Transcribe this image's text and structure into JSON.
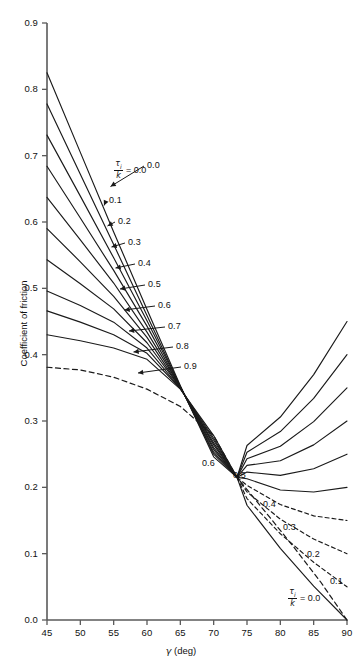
{
  "chart_data": {
    "type": "line",
    "title": "",
    "xlabel": "γ (deg)",
    "ylabel": "Coefficient of friction",
    "xlim": [
      45,
      90
    ],
    "ylim": [
      0.0,
      0.9
    ],
    "xticks": [
      "45",
      "50",
      "55",
      "60",
      "65",
      "70",
      "75",
      "80",
      "85",
      "90"
    ],
    "xtick_values": [
      45,
      50,
      55,
      60,
      65,
      70,
      75,
      80,
      85,
      90
    ],
    "yticks": [
      "0.0",
      "0.1",
      "0.2",
      "0.3",
      "0.4",
      "0.5",
      "0.6",
      "0.7",
      "0.8",
      "0.9"
    ],
    "ytick_values": [
      0.0,
      0.1,
      0.2,
      0.3,
      0.4,
      0.5,
      0.6,
      0.7,
      0.8,
      0.9
    ],
    "grid": false,
    "legend": "inline-curve-labels",
    "series_parameter_symbol": "τi/k",
    "convergence_point": {
      "x": 73.5,
      "y": 0.215
    },
    "series": [
      {
        "name": "0.0",
        "label": "0.0",
        "style": "solid",
        "x": [
          45,
          50,
          55,
          60,
          65,
          70,
          73.5,
          75,
          80,
          85,
          90
        ],
        "values": [
          0.825,
          0.705,
          0.585,
          0.468,
          0.353,
          0.246,
          0.215,
          0.173,
          0.108,
          0.051,
          0.0
        ]
      },
      {
        "name": "0.1",
        "label": "0.1",
        "style": "solid-left-dashed-right",
        "x": [
          45,
          50,
          55,
          60,
          65,
          70,
          73.5,
          75,
          80,
          85,
          90
        ],
        "values": [
          0.778,
          0.672,
          0.566,
          0.459,
          0.352,
          0.25,
          0.215,
          0.183,
          0.13,
          0.087,
          0.05
        ]
      },
      {
        "name": "0.2",
        "label": "0.2",
        "style": "solid-left-dashed-right",
        "x": [
          45,
          50,
          55,
          60,
          65,
          70,
          73.5,
          75,
          80,
          85,
          90
        ],
        "values": [
          0.731,
          0.639,
          0.546,
          0.451,
          0.352,
          0.253,
          0.215,
          0.193,
          0.152,
          0.122,
          0.1
        ]
      },
      {
        "name": "0.3",
        "label": "0.3",
        "style": "solid-left-dashed-right",
        "x": [
          45,
          50,
          55,
          60,
          65,
          70,
          73.5,
          75,
          80,
          85,
          90
        ],
        "values": [
          0.684,
          0.606,
          0.527,
          0.443,
          0.351,
          0.257,
          0.215,
          0.203,
          0.174,
          0.157,
          0.15
        ]
      },
      {
        "name": "0.4",
        "label": "0.4",
        "style": "solid",
        "x": [
          45,
          50,
          55,
          60,
          65,
          70,
          73.5,
          75,
          80,
          85,
          90
        ],
        "values": [
          0.637,
          0.573,
          0.508,
          0.434,
          0.351,
          0.26,
          0.215,
          0.213,
          0.196,
          0.193,
          0.2
        ]
      },
      {
        "name": "0.5",
        "label": "0.5",
        "style": "solid",
        "x": [
          45,
          50,
          55,
          60,
          65,
          70,
          73.5,
          75,
          80,
          85,
          90
        ],
        "values": [
          0.59,
          0.54,
          0.488,
          0.426,
          0.35,
          0.264,
          0.215,
          0.223,
          0.218,
          0.228,
          0.25
        ]
      },
      {
        "name": "0.6",
        "label": "0.6",
        "style": "solid",
        "x": [
          45,
          50,
          55,
          60,
          65,
          70,
          73.5,
          75,
          80,
          85,
          90
        ],
        "values": [
          0.543,
          0.507,
          0.469,
          0.418,
          0.35,
          0.267,
          0.215,
          0.233,
          0.24,
          0.264,
          0.3
        ]
      },
      {
        "name": "0.7",
        "label": "0.7",
        "style": "solid",
        "x": [
          45,
          50,
          55,
          60,
          65,
          70,
          73.5,
          75,
          80,
          85,
          90
        ],
        "values": [
          0.496,
          0.474,
          0.449,
          0.41,
          0.349,
          0.271,
          0.215,
          0.243,
          0.262,
          0.299,
          0.35
        ]
      },
      {
        "name": "0.8",
        "label": "0.8",
        "style": "solid",
        "x": [
          45,
          50,
          55,
          60,
          65,
          70,
          73.5,
          75,
          80,
          85,
          90
        ],
        "values": [
          0.466,
          0.449,
          0.43,
          0.402,
          0.349,
          0.274,
          0.215,
          0.253,
          0.284,
          0.334,
          0.4
        ]
      },
      {
        "name": "0.9",
        "label": "0.9",
        "style": "solid",
        "x": [
          45,
          50,
          55,
          60,
          65,
          70,
          73.5,
          75,
          80,
          85,
          90
        ],
        "values": [
          0.43,
          0.421,
          0.41,
          0.393,
          0.348,
          0.278,
          0.215,
          0.263,
          0.306,
          0.37,
          0.45
        ]
      }
    ],
    "envelope": {
      "name": "envelope",
      "style": "dashed",
      "x": [
        45,
        50,
        55,
        60,
        65,
        70,
        73.5,
        78,
        82,
        86,
        90
      ],
      "values": [
        0.381,
        0.377,
        0.366,
        0.348,
        0.322,
        0.278,
        0.215,
        0.16,
        0.11,
        0.058,
        0.0
      ]
    },
    "annotations_upper_left": [
      {
        "text": "0.0",
        "series": "0.0"
      },
      {
        "text": "0.1",
        "series": "0.1"
      },
      {
        "text": "0.2",
        "series": "0.2"
      },
      {
        "text": "0.3",
        "series": "0.3"
      },
      {
        "text": "0.4",
        "series": "0.4"
      },
      {
        "text": "0.5",
        "series": "0.5"
      },
      {
        "text": "0.6",
        "series": "0.6"
      },
      {
        "text": "0.7",
        "series": "0.7"
      },
      {
        "text": "0.8",
        "series": "0.8"
      },
      {
        "text": "0.9",
        "series": "0.9"
      }
    ],
    "annotations_lower_right": [
      {
        "text": "0.6",
        "series": "0.6"
      },
      {
        "text": "0.5",
        "series": "0.5"
      },
      {
        "text": "0.4",
        "series": "0.4"
      },
      {
        "text": "0.3",
        "series": "0.3"
      },
      {
        "text": "0.2",
        "series": "0.2"
      },
      {
        "text": "0.1",
        "series": "0.1"
      },
      {
        "text": "0.0",
        "series": "0.0"
      }
    ]
  },
  "axes": {
    "y_title": "Coefficient of friction",
    "x_title_symbol": "γ",
    "x_title_unit": "(deg)",
    "x_ticks": [
      "45",
      "50",
      "55",
      "60",
      "65",
      "70",
      "75",
      "80",
      "85",
      "90"
    ],
    "y_ticks": [
      "0.9",
      "0.8",
      "0.7",
      "0.6",
      "0.5",
      "0.4",
      "0.3",
      "0.2",
      "0.1",
      "0.0"
    ]
  },
  "ratio_tag": {
    "numerator": "τ",
    "numerator_sub": "i",
    "denominator": "k",
    "equals": "= 0.0"
  },
  "curve_labels_upper": [
    "0.0",
    "0.1",
    "0.2",
    "0.3",
    "0.4",
    "0.5",
    "0.6",
    "0.7",
    "0.8",
    "0.9"
  ],
  "curve_labels_lower": [
    "0.6",
    "0.5",
    "0.4",
    "0.3",
    "0.2",
    "0.1",
    "0.0"
  ],
  "colors": {
    "line": "#1a1a1a",
    "axis": "#5a5a5a",
    "text": "#111111",
    "background": "#ffffff"
  }
}
